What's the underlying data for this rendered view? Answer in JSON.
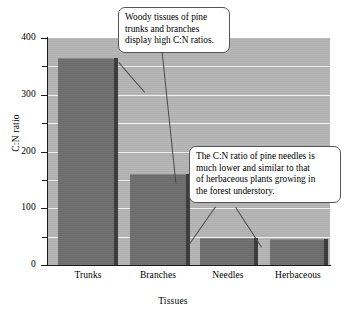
{
  "chart_data": {
    "type": "bar",
    "title": "",
    "subtitle": "",
    "xlabel": "Tissues",
    "ylabel": "C:N ratio",
    "categories": [
      "Trunks",
      "Branches",
      "Needles",
      "Herbaceous"
    ],
    "values": [
      365,
      160,
      48,
      45
    ],
    "ylim": [
      0,
      400
    ],
    "xlim": null,
    "y_ticks_major": [
      0,
      100,
      200,
      300,
      400
    ],
    "y_ticks_major_labels": [
      "0",
      "100",
      "200",
      "300",
      "400"
    ],
    "y_ticks_minor": [
      50,
      150,
      250,
      350
    ],
    "grid": true,
    "grid_axis": "y",
    "grid_color": "#efefef",
    "legend": null,
    "legend_position": "none",
    "plot_background": "#b5b5b5",
    "bar_color": "#6e6e6e",
    "bar_shadow_color": "#3d3d3d",
    "annotations": [
      {
        "id": "callout-woody",
        "text": "Woody tissues of pine trunks and branches display high C:N ratios.",
        "points_to": [
          "Trunks",
          "Branches"
        ]
      },
      {
        "id": "callout-needles",
        "text": "The C:N ratio of pine needles is much lower and similar to that of herbaceous plants growing in the forest understory.",
        "points_to": [
          "Needles",
          "Herbaceous"
        ]
      }
    ]
  },
  "axes": {
    "y_title": "C:N ratio",
    "x_title": "Tissues",
    "y_labels": [
      "400",
      "300",
      "200",
      "100",
      "0"
    ],
    "x_labels": [
      "Trunks",
      "Branches",
      "Needles",
      "Herbaceous"
    ]
  },
  "callouts": {
    "woody": {
      "line1": "Woody tissues of pine",
      "line2": "trunks and branches",
      "line3": "display high C:N ratios."
    },
    "needles": {
      "line1": "The C:N ratio of pine needles is",
      "line2": "much lower and similar to that",
      "line3": "of herbaceous plants growing in",
      "line4": "the forest understory."
    }
  }
}
